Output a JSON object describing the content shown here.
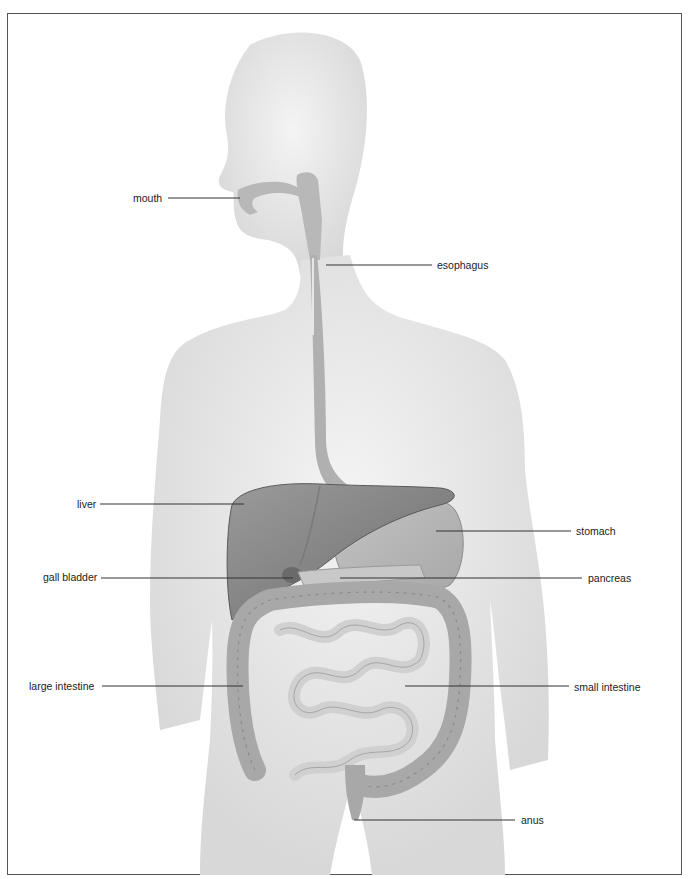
{
  "diagram": {
    "title": "",
    "colors": {
      "silhouette": "#dcdcdc",
      "organ_dark": "#8a8a8a",
      "organ_mid": "#b5b5b5",
      "organ_light": "#d6d6d6",
      "leader_line": "#333333",
      "frame": "#555555"
    },
    "labels": [
      {
        "id": "mouth",
        "text": "mouth",
        "side": "left",
        "x": 133,
        "y": 198,
        "line": [
          168,
          198,
          240,
          198
        ]
      },
      {
        "id": "esophagus",
        "text": "esophagus",
        "side": "right",
        "x": 437,
        "y": 266,
        "line": [
          326,
          265,
          432,
          265
        ]
      },
      {
        "id": "liver",
        "text": "liver",
        "side": "left",
        "x": 77,
        "y": 504,
        "line": [
          100,
          504,
          244,
          504
        ]
      },
      {
        "id": "stomach",
        "text": "stomach",
        "side": "right",
        "x": 576,
        "y": 532,
        "line": [
          436,
          531,
          571,
          531
        ]
      },
      {
        "id": "gall_bladder",
        "text": "gall bladder",
        "side": "left",
        "x": 43,
        "y": 577,
        "line": [
          101,
          578,
          293,
          578
        ]
      },
      {
        "id": "pancreas",
        "text": "pancreas",
        "side": "right",
        "x": 588,
        "y": 579,
        "line": [
          340,
          578,
          582,
          578
        ]
      },
      {
        "id": "large_intestine",
        "text": "large intestine",
        "side": "left",
        "x": 29,
        "y": 686,
        "line": [
          102,
          686,
          243,
          686
        ]
      },
      {
        "id": "small_intestine",
        "text": "small intestine",
        "side": "right",
        "x": 574,
        "y": 687,
        "line": [
          405,
          686,
          569,
          686
        ]
      },
      {
        "id": "anus",
        "text": "anus",
        "side": "right",
        "x": 521,
        "y": 821,
        "line": [
          354,
          820,
          515,
          820
        ]
      }
    ]
  }
}
